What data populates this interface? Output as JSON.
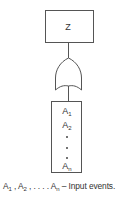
{
  "diagram": {
    "type": "fault-tree-or-gate",
    "top_event": {
      "label": "Z"
    },
    "gate": {
      "type": "OR"
    },
    "inputs": {
      "items": [
        {
          "base": "A",
          "sub": "1"
        },
        {
          "base": "A",
          "sub": "2"
        },
        {
          "base": "A",
          "sub": "n"
        }
      ],
      "ellipsis_dots": 3
    },
    "caption": {
      "a1": "A",
      "a1_sub": "1",
      "a2": "A",
      "a2_sub": "2",
      "sep1": " , ",
      "sep2": " , . . . . ",
      "an": "A",
      "an_sub": "n",
      "text": " – Input events."
    },
    "colors": {
      "stroke": "#4a4a4a",
      "background": "#ffffff"
    }
  }
}
